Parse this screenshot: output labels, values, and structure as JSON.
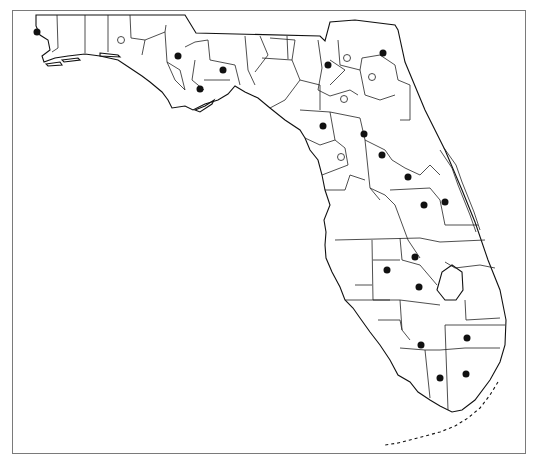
{
  "map": {
    "title": "",
    "region": "Florida counties",
    "frame_color": "#7a7a7a",
    "legend": [
      {
        "symbol": "filled-circle",
        "color": "#111111"
      },
      {
        "symbol": "open-circle",
        "color": "#ffffff"
      }
    ],
    "markers": [
      {
        "type": "filled",
        "x": 37,
        "y": 32
      },
      {
        "type": "open",
        "x": 121,
        "y": 40
      },
      {
        "type": "filled",
        "x": 178,
        "y": 56
      },
      {
        "type": "filled",
        "x": 223,
        "y": 70
      },
      {
        "type": "filled",
        "x": 200,
        "y": 89
      },
      {
        "type": "filled",
        "x": 328,
        "y": 65
      },
      {
        "type": "open",
        "x": 347,
        "y": 58
      },
      {
        "type": "filled",
        "x": 383,
        "y": 53
      },
      {
        "type": "open",
        "x": 372,
        "y": 77
      },
      {
        "type": "open",
        "x": 344,
        "y": 99
      },
      {
        "type": "filled",
        "x": 323,
        "y": 126
      },
      {
        "type": "filled",
        "x": 364,
        "y": 134
      },
      {
        "type": "open",
        "x": 341,
        "y": 157
      },
      {
        "type": "filled",
        "x": 382,
        "y": 155
      },
      {
        "type": "filled",
        "x": 408,
        "y": 177
      },
      {
        "type": "filled",
        "x": 424,
        "y": 205
      },
      {
        "type": "filled",
        "x": 445,
        "y": 202
      },
      {
        "type": "filled",
        "x": 415,
        "y": 257
      },
      {
        "type": "filled",
        "x": 387,
        "y": 270
      },
      {
        "type": "filled",
        "x": 419,
        "y": 287
      },
      {
        "type": "filled",
        "x": 467,
        "y": 338
      },
      {
        "type": "filled",
        "x": 421,
        "y": 345
      },
      {
        "type": "filled",
        "x": 440,
        "y": 378
      },
      {
        "type": "filled",
        "x": 466,
        "y": 374
      }
    ],
    "annotations": [
      {
        "text": "Florida Keys",
        "x": 415,
        "y": 446
      }
    ]
  }
}
